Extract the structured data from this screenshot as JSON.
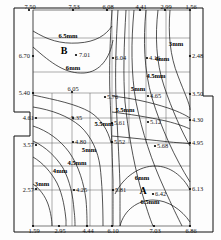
{
  "chart_data": {
    "type": "contour",
    "title": "",
    "xlabel": "",
    "ylabel": "",
    "units": "mm",
    "contour_levels": [
      3,
      4,
      4.5,
      5,
      5.5,
      6,
      6.5
    ],
    "contour_labels": [
      {
        "id": "c-65-top",
        "text": "6.5mm",
        "x": 68,
        "y": 38
      },
      {
        "id": "c-6-top",
        "text": "6mm",
        "x": 73,
        "y": 70
      },
      {
        "id": "c-3-right",
        "text": "3mm",
        "x": 176,
        "y": 46
      },
      {
        "id": "c-4-right",
        "text": "4mm",
        "x": 162,
        "y": 61
      },
      {
        "id": "c-45-right",
        "text": "4.5mm",
        "x": 156,
        "y": 78
      },
      {
        "id": "c-5-mid",
        "text": "5mm",
        "x": 138,
        "y": 91
      },
      {
        "id": "c-55-midr",
        "text": "5.5mm",
        "x": 125,
        "y": 112
      },
      {
        "id": "c-55-midl",
        "text": "5.5mm",
        "x": 104,
        "y": 126
      },
      {
        "id": "c-5-left",
        "text": "5mm",
        "x": 89,
        "y": 152
      },
      {
        "id": "c-45-left",
        "text": "4.5mm",
        "x": 77,
        "y": 165
      },
      {
        "id": "c-4-left",
        "text": "4mm",
        "x": 60,
        "y": 173
      },
      {
        "id": "c-3-left",
        "text": "3mm",
        "x": 42,
        "y": 186
      },
      {
        "id": "c-6-bot",
        "text": "6mm",
        "x": 142,
        "y": 180
      },
      {
        "id": "c-65-bot",
        "text": "6.5mm",
        "x": 150,
        "y": 204
      }
    ],
    "peak_labels": [
      {
        "id": "peak-B",
        "text": "B",
        "x": 64,
        "y": 54
      },
      {
        "id": "peak-A",
        "text": "A",
        "x": 143,
        "y": 194
      }
    ],
    "data_points": [
      {
        "id": "p-top-1",
        "value": "7.50",
        "x": 29,
        "y": 10,
        "lx": 30,
        "ly": 9,
        "anchor": "middle"
      },
      {
        "id": "p-top-2",
        "value": "7.53",
        "x": 73,
        "y": 10,
        "lx": 74,
        "ly": 9,
        "anchor": "middle"
      },
      {
        "id": "p-top-3",
        "value": "6.08",
        "x": 107,
        "y": 10,
        "lx": 108,
        "ly": 9,
        "anchor": "middle"
      },
      {
        "id": "p-top-4",
        "value": "4.41",
        "x": 140,
        "y": 10,
        "lx": 141,
        "ly": 9,
        "anchor": "middle"
      },
      {
        "id": "p-top-5",
        "value": "2.99",
        "x": 165,
        "y": 10,
        "lx": 166,
        "ly": 9,
        "anchor": "middle"
      },
      {
        "id": "p-top-6",
        "value": "1.56",
        "x": 190,
        "y": 10,
        "lx": 191,
        "ly": 9,
        "anchor": "middle"
      },
      {
        "id": "p-left-1",
        "value": "6.70",
        "x": 33,
        "y": 56,
        "lx": 30,
        "ly": 58,
        "anchor": "end"
      },
      {
        "id": "p-left-2",
        "value": "5.40",
        "x": 33,
        "y": 93,
        "lx": 30,
        "ly": 95,
        "anchor": "end"
      },
      {
        "id": "p-left-3",
        "value": "4.61",
        "x": 36,
        "y": 118,
        "lx": 34,
        "ly": 120,
        "anchor": "end"
      },
      {
        "id": "p-left-4",
        "value": "3.57",
        "x": 36,
        "y": 145,
        "lx": 34,
        "ly": 147,
        "anchor": "end"
      },
      {
        "id": "p-left-5",
        "value": "2.57",
        "x": 36,
        "y": 189,
        "lx": 34,
        "ly": 192,
        "anchor": "end"
      },
      {
        "id": "p-b",
        "value": "7.01",
        "x": 76,
        "y": 55,
        "lx": 79,
        "ly": 57,
        "anchor": "start"
      },
      {
        "id": "p-604",
        "value": "6.04",
        "x": 113,
        "y": 58,
        "lx": 115,
        "ly": 60,
        "anchor": "start"
      },
      {
        "id": "p-416",
        "value": "4.16",
        "x": 147,
        "y": 58,
        "lx": 149,
        "ly": 60,
        "anchor": "start"
      },
      {
        "id": "p-248",
        "value": "2.48",
        "x": 190,
        "y": 56,
        "lx": 192,
        "ly": 58,
        "anchor": "start"
      },
      {
        "id": "p-605",
        "value": "6.05",
        "x": 72,
        "y": 92,
        "lx": 73,
        "ly": 91,
        "anchor": "middle"
      },
      {
        "id": "p-576",
        "value": "5.76",
        "x": 105,
        "y": 97,
        "lx": 107,
        "ly": 99,
        "anchor": "start"
      },
      {
        "id": "p-465",
        "value": "4.65",
        "x": 148,
        "y": 96,
        "lx": 150,
        "ly": 98,
        "anchor": "start"
      },
      {
        "id": "p-350",
        "value": "3.50",
        "x": 190,
        "y": 94,
        "lx": 192,
        "ly": 96,
        "anchor": "start"
      },
      {
        "id": "p-535",
        "value": "5.35",
        "x": 73,
        "y": 118,
        "lx": 71,
        "ly": 120,
        "anchor": "start"
      },
      {
        "id": "p-561",
        "value": "5.61",
        "x": 112,
        "y": 123,
        "lx": 114,
        "ly": 125,
        "anchor": "start"
      },
      {
        "id": "p-512",
        "value": "5.12",
        "x": 148,
        "y": 122,
        "lx": 150,
        "ly": 124,
        "anchor": "start"
      },
      {
        "id": "p-430",
        "value": "4.30",
        "x": 190,
        "y": 120,
        "lx": 192,
        "ly": 122,
        "anchor": "start"
      },
      {
        "id": "p-480",
        "value": "4.80",
        "x": 73,
        "y": 142,
        "lx": 75,
        "ly": 144,
        "anchor": "start"
      },
      {
        "id": "p-552",
        "value": "5.52",
        "x": 112,
        "y": 142,
        "lx": 114,
        "ly": 144,
        "anchor": "start"
      },
      {
        "id": "p-568",
        "value": "5.68",
        "x": 155,
        "y": 146,
        "lx": 157,
        "ly": 148,
        "anchor": "start"
      },
      {
        "id": "p-495",
        "value": "4.95",
        "x": 190,
        "y": 143,
        "lx": 192,
        "ly": 145,
        "anchor": "start"
      },
      {
        "id": "p-425",
        "value": "4.25",
        "x": 74,
        "y": 190,
        "lx": 76,
        "ly": 192,
        "anchor": "start"
      },
      {
        "id": "p-581",
        "value": "5.81",
        "x": 113,
        "y": 190,
        "lx": 115,
        "ly": 192,
        "anchor": "start"
      },
      {
        "id": "p-a",
        "value": "6.42",
        "x": 153,
        "y": 194,
        "lx": 155,
        "ly": 196,
        "anchor": "start"
      },
      {
        "id": "p-613",
        "value": "6.13",
        "x": 190,
        "y": 189,
        "lx": 192,
        "ly": 191,
        "anchor": "start"
      },
      {
        "id": "p-bot-1",
        "value": "1.59",
        "x": 33,
        "y": 226,
        "lx": 34,
        "ly": 233,
        "anchor": "middle"
      },
      {
        "id": "p-bot-2",
        "value": "2.95",
        "x": 59,
        "y": 226,
        "lx": 60,
        "ly": 233,
        "anchor": "middle"
      },
      {
        "id": "p-bot-3",
        "value": "4.44",
        "x": 87,
        "y": 226,
        "lx": 88,
        "ly": 233,
        "anchor": "middle"
      },
      {
        "id": "p-bot-4",
        "value": "6.10",
        "x": 112,
        "y": 226,
        "lx": 113,
        "ly": 233,
        "anchor": "middle"
      },
      {
        "id": "p-bot-5",
        "value": "7.03",
        "x": 154,
        "y": 226,
        "lx": 155,
        "ly": 233,
        "anchor": "middle"
      },
      {
        "id": "p-bot-6",
        "value": "6.86",
        "x": 190,
        "y": 226,
        "lx": 191,
        "ly": 233,
        "anchor": "middle"
      }
    ],
    "grid_horizontal": [
      {
        "id": "gh-1",
        "x1": 33,
        "x2": 190,
        "y": 38
      },
      {
        "id": "gh-2",
        "x1": 33,
        "x2": 190,
        "y": 72
      },
      {
        "id": "gh-3",
        "x1": 33,
        "x2": 190,
        "y": 93
      },
      {
        "id": "gh-4",
        "x1": 33,
        "x2": 190,
        "y": 118
      },
      {
        "id": "gh-5",
        "x1": 33,
        "x2": 190,
        "y": 143
      },
      {
        "id": "gh-6",
        "x1": 33,
        "x2": 190,
        "y": 166
      },
      {
        "id": "gh-7",
        "x1": 33,
        "x2": 190,
        "y": 190
      }
    ],
    "grid_vertical": [
      {
        "id": "gv-1",
        "y1": 10,
        "y2": 226,
        "x": 33
      },
      {
        "id": "gv-2",
        "y1": 93,
        "y2": 226,
        "x": 52
      },
      {
        "id": "gv-3",
        "y1": 93,
        "y2": 226,
        "x": 72
      },
      {
        "id": "gv-4",
        "y1": 93,
        "y2": 226,
        "x": 90
      },
      {
        "id": "gv-5",
        "y1": 10,
        "y2": 226,
        "x": 112
      },
      {
        "id": "gv-6",
        "y1": 10,
        "y2": 143,
        "x": 129
      },
      {
        "id": "gv-7",
        "y1": 10,
        "y2": 143,
        "x": 146
      },
      {
        "id": "gv-8",
        "y1": 10,
        "y2": 143,
        "x": 166
      },
      {
        "id": "gv-9",
        "y1": 10,
        "y2": 226,
        "x": 190
      }
    ],
    "contours": [
      {
        "id": "k-65-top",
        "level": "6.5",
        "d": "M33,31 C48,40 60,44 78,43 C96,42 106,35 112,26"
      },
      {
        "id": "k-6-top",
        "level": "6",
        "d": "M33,47 C52,64 66,74 84,73 C100,72 110,58 113,40"
      },
      {
        "id": "k-6-mid",
        "level": "6",
        "d": "M33,95 C56,100 76,104 90,112 C101,119 108,130 111,143"
      },
      {
        "id": "k-55",
        "level": "5.5",
        "d": "M33,107 C52,110 68,116 80,126 C92,137 98,152 100,166 C102,182 103,205 103,226"
      },
      {
        "id": "k-5",
        "level": "5",
        "d": "M33,126 C48,131 60,140 69,152 C79,166 84,184 86,200 C87,212 87,220 87,226"
      },
      {
        "id": "k-45",
        "level": "4.5",
        "d": "M33,141 C46,147 56,157 63,168 C70,181 73,196 74,210 C75,218 75,223 75,226"
      },
      {
        "id": "k-4",
        "level": "4",
        "d": "M33,157 C43,163 51,172 57,183 C63,195 65,210 66,220 C66,224 66,226 66,226"
      },
      {
        "id": "k-3",
        "level": "3",
        "d": "M33,184 C40,189 45,196 48,204 C51,213 52,221 52,226"
      },
      {
        "id": "k-5-ctr",
        "level": "5",
        "d": "M112,10 C110,40 109,70 110,96 C111,120 112,150 113,180 C113,205 113,218 113,226"
      },
      {
        "id": "k-55-ctr",
        "level": "5.5",
        "d": "M118,10 C116,42 115,72 116,98 C117,124 119,155 120,185 C120,208 120,219 120,226"
      },
      {
        "id": "k-5-r",
        "level": "5",
        "d": "M126,10 C124,44 123,76 125,102 C128,130 133,160 140,186 C146,207 150,219 153,226"
      },
      {
        "id": "k-45-r",
        "level": "4.5",
        "d": "M134,10 C131,42 131,74 136,102 C142,132 152,162 164,188 C172,206 178,218 182,226"
      },
      {
        "id": "k-4-r",
        "level": "4",
        "d": "M146,10 C143,40 144,70 152,98 C161,128 175,158 190,182"
      },
      {
        "id": "k-3-r",
        "level": "3",
        "d": "M170,10 C168,34 170,56 178,76 C184,92 190,104 190,110"
      },
      {
        "id": "k-35-r",
        "level": "3.5",
        "d": "M158,10 C155,36 156,62 164,86 C172,110 182,132 190,146"
      },
      {
        "id": "k-6-A",
        "level": "6",
        "d": "M115,194 C124,176 140,166 155,166 C170,166 183,176 190,190"
      },
      {
        "id": "k-65-A",
        "level": "6.5",
        "d": "M120,226 C124,210 138,200 153,200 C168,200 182,210 190,222"
      },
      {
        "id": "k-55-upper",
        "level": "5.5",
        "d": "M112,112 C128,114 148,117 166,121 C178,124 186,127 190,129"
      },
      {
        "id": "k-5-upper",
        "level": "5",
        "d": "M112,96 C130,98 150,102 168,108 C180,112 187,116 190,118"
      },
      {
        "id": "k-5b-upper",
        "level": "5",
        "d": "M112,136 C132,138 152,140 170,142 C180,143 187,143 190,144"
      }
    ],
    "outline": {
      "id": "map-outline",
      "d": "M14,8 L203,8 L203,96 L213,96 L213,232 L14,232 Z"
    },
    "inner_frame": {
      "id": "inner-frame",
      "d": "M33,10 L190,10 L190,226 L33,226 Z"
    },
    "notch_left": {
      "id": "left-notch",
      "d": "M14,136 L33,136"
    }
  }
}
